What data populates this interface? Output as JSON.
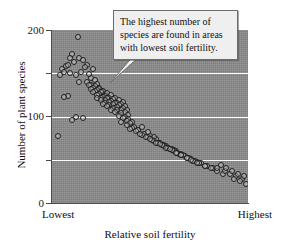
{
  "figure": {
    "background_color": "#ffffff",
    "plot_background_color": "#8c8c8c",
    "gridline_color": "#ffffff",
    "axis_color": "#4a4a4a",
    "point_outline_color": "#202020"
  },
  "callout": {
    "text": "The highest number of species are found in areas with lowest soil fertility.",
    "background_color": "#efefef",
    "border_color": "#6c6c6c"
  },
  "axes": {
    "y_title": "Number of plant species",
    "x_title": "Relative soil fertility",
    "x_label_left": "Lowest",
    "x_label_right": "Highest",
    "y_tick_labels": [
      "200",
      "100",
      "0"
    ]
  },
  "chart_data": {
    "type": "scatter",
    "title": "",
    "subtitle": "",
    "xlabel": "Relative soil fertility",
    "ylabel": "Number of plant species",
    "xlim": [
      0,
      100
    ],
    "ylim": [
      0,
      200
    ],
    "xticks": [
      0,
      100
    ],
    "xticklabels": [
      "Lowest",
      "Highest"
    ],
    "yticks": [
      0,
      50,
      100,
      150,
      200
    ],
    "yticklabels": [
      "0",
      "",
      "100",
      "",
      "200"
    ],
    "grid": true,
    "gridlines_y": [
      50,
      100,
      150
    ],
    "legend": null,
    "annotations": [
      {
        "text": "The highest number of species are found in areas with lowest soil fertility.",
        "points_to_x": 34,
        "points_to_y": 145
      }
    ],
    "marker": {
      "style": "open-circle",
      "size": 6
    },
    "series": [
      {
        "name": "plots",
        "x": [
          13,
          14,
          5,
          7,
          9,
          11,
          10,
          16,
          18,
          12,
          15,
          17,
          20,
          8,
          19,
          22,
          21,
          6,
          4,
          23,
          24,
          25,
          26,
          27,
          28,
          29,
          30,
          31,
          32,
          33,
          18,
          20,
          22,
          24,
          26,
          28,
          30,
          32,
          34,
          36,
          19,
          21,
          23,
          25,
          27,
          29,
          31,
          33,
          35,
          37,
          20,
          22,
          24,
          26,
          28,
          30,
          32,
          34,
          36,
          38,
          21,
          23,
          25,
          27,
          29,
          31,
          33,
          35,
          37,
          39,
          23,
          25,
          27,
          29,
          31,
          33,
          35,
          37,
          39,
          41,
          26,
          28,
          30,
          32,
          34,
          36,
          38,
          40,
          42,
          44,
          3,
          6,
          10,
          16,
          12,
          9,
          14,
          8,
          35,
          38,
          41,
          44,
          47,
          50,
          53,
          46,
          49,
          52,
          40,
          43,
          46,
          49,
          52,
          55,
          58,
          61,
          54,
          57,
          45,
          48,
          51,
          54,
          57,
          60,
          63,
          66,
          59,
          62,
          50,
          53,
          56,
          59,
          62,
          65,
          68,
          71,
          74,
          64,
          55,
          58,
          61,
          64,
          67,
          70,
          73,
          76,
          79,
          82,
          60,
          63,
          66,
          69,
          72,
          75,
          78,
          81,
          84,
          87,
          66,
          69,
          72,
          75,
          78,
          84,
          88,
          91,
          94,
          97,
          71,
          74,
          86,
          89,
          92,
          95,
          98,
          99,
          96,
          93
        ],
        "y": [
          192,
          168,
          155,
          158,
          150,
          163,
          172,
          165,
          160,
          148,
          152,
          157,
          145,
          124,
          149,
          142,
          155,
          152,
          148,
          138,
          133,
          130,
          128,
          126,
          122,
          118,
          115,
          113,
          110,
          108,
          140,
          137,
          135,
          132,
          129,
          127,
          125,
          121,
          119,
          117,
          136,
          133,
          131,
          128,
          124,
          122,
          120,
          116,
          114,
          112,
          132,
          129,
          126,
          123,
          121,
          118,
          116,
          113,
          110,
          107,
          128,
          125,
          122,
          119,
          117,
          114,
          111,
          108,
          105,
          102,
          122,
          119,
          116,
          113,
          110,
          107,
          104,
          100,
          97,
          94,
          115,
          112,
          108,
          105,
          101,
          98,
          95,
          92,
          88,
          85,
          78,
          123,
          96,
          98,
          100,
          168,
          140,
          160,
          94,
          90,
          87,
          84,
          80,
          77,
          74,
          88,
          82,
          76,
          86,
          83,
          79,
          76,
          72,
          69,
          66,
          63,
          70,
          67,
          80,
          76,
          73,
          70,
          66,
          63,
          60,
          57,
          64,
          61,
          74,
          70,
          67,
          64,
          60,
          57,
          54,
          51,
          48,
          58,
          68,
          64,
          61,
          58,
          55,
          52,
          49,
          46,
          43,
          40,
          62,
          58,
          55,
          52,
          49,
          46,
          43,
          40,
          37,
          34,
          56,
          52,
          49,
          46,
          43,
          40,
          37,
          34,
          31,
          28,
          50,
          46,
          44,
          40,
          37,
          34,
          31,
          22,
          25,
          28
        ]
      }
    ]
  }
}
